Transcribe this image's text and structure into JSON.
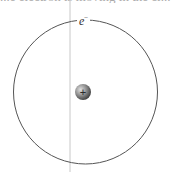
{
  "diagram": {
    "top_text_fragment": "...e electron is moving in the cl...",
    "electron_label": "e",
    "electron_charge": "−",
    "nucleus_symbol": "+",
    "colors": {
      "orbit": "#555555",
      "axis_line": "#c8c8c8",
      "nucleus_light": "#bdbdbd",
      "nucleus_dark": "#4a4a4a"
    }
  }
}
